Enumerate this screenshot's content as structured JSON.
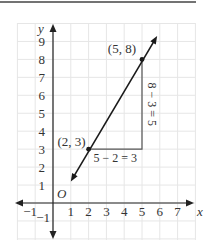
{
  "figure": {
    "top_rule": true,
    "origin_label": "O",
    "x_axis_label": "x",
    "y_axis_label": "y",
    "x_tick_labels": [
      "−1",
      "1",
      "2",
      "3",
      "4",
      "5",
      "6",
      "7"
    ],
    "x_tick_values": [
      -1,
      1,
      2,
      3,
      4,
      5,
      6,
      7
    ],
    "y_tick_labels": [
      "−1",
      "1",
      "2",
      "3",
      "4",
      "5",
      "6",
      "7",
      "8",
      "9"
    ],
    "y_tick_values": [
      -1,
      1,
      2,
      3,
      4,
      5,
      6,
      7,
      8,
      9
    ],
    "grid": {
      "x_min": -2,
      "x_max": 8,
      "y_min": -2,
      "y_max": 10,
      "step": 1
    },
    "line": {
      "from": [
        1,
        1.2
      ],
      "to": [
        5.85,
        9.3
      ],
      "label": "line through (2,3) and (5,8)"
    },
    "points": [
      {
        "x": 2,
        "y": 3,
        "label": "(2, 3)"
      },
      {
        "x": 5,
        "y": 8,
        "label": "(5, 8)"
      }
    ],
    "run_label": "5 − 2 = 3",
    "rise_label": "8 − 3 = 5",
    "colors": {
      "grid": "#e6e6e6",
      "axis": "#222222",
      "line": "#1a1a1a",
      "triangle": "#555555",
      "text": "#333333",
      "rule": "#444444"
    }
  }
}
